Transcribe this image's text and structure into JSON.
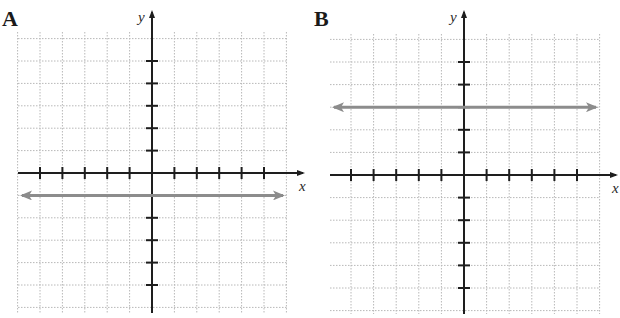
{
  "panels": [
    {
      "id": "A",
      "label": "A",
      "x_axis_label": "x",
      "y_axis_label": "y",
      "grid": {
        "x_min": -6,
        "x_max": 6,
        "y_min": -6,
        "y_max": 6
      },
      "line": {
        "type": "horizontal",
        "equation": "y = -1",
        "y": -1
      }
    },
    {
      "id": "B",
      "label": "B",
      "x_axis_label": "x",
      "y_axis_label": "y",
      "grid": {
        "x_min": -6,
        "x_max": 6,
        "y_min": -6,
        "y_max": 6
      },
      "line": {
        "type": "horizontal",
        "equation": "y = 3",
        "y": 3
      }
    }
  ],
  "colors": {
    "axis": "#1e1e1e",
    "grid": "#b8b8b8",
    "line": "#8c8c8c",
    "background": "#ffffff"
  },
  "chart_data": [
    {
      "type": "line",
      "title": "A",
      "xlabel": "x",
      "ylabel": "y",
      "xlim": [
        -6,
        6
      ],
      "ylim": [
        -6,
        6
      ],
      "grid": true,
      "x_ticks": [
        -5,
        -4,
        -3,
        -2,
        -1,
        1,
        2,
        3,
        4,
        5
      ],
      "y_ticks": [
        -5,
        -4,
        -3,
        -2,
        -1,
        1,
        2,
        3,
        4,
        5
      ],
      "series": [
        {
          "name": "y = -1",
          "x": [
            -6,
            6
          ],
          "y": [
            -1,
            -1
          ],
          "arrows": "both"
        }
      ]
    },
    {
      "type": "line",
      "title": "B",
      "xlabel": "x",
      "ylabel": "y",
      "xlim": [
        -6,
        6
      ],
      "ylim": [
        -6,
        6
      ],
      "grid": true,
      "x_ticks": [
        -5,
        -4,
        -3,
        -2,
        -1,
        1,
        2,
        3,
        4,
        5
      ],
      "y_ticks": [
        -5,
        -4,
        -3,
        -2,
        -1,
        1,
        2,
        3,
        4,
        5
      ],
      "series": [
        {
          "name": "y = 3",
          "x": [
            -6,
            6
          ],
          "y": [
            3,
            3
          ],
          "arrows": "both"
        }
      ]
    }
  ]
}
